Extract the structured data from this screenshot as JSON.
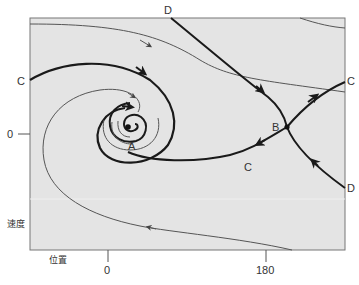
{
  "diagram": {
    "type": "phase-portrait",
    "axes": {
      "x_label": "位置",
      "y_label": "速度",
      "x_ticks": [
        "0",
        "180"
      ],
      "y_ticks": [
        "0"
      ]
    },
    "points": {
      "A": "A",
      "B": "B"
    },
    "curve_labels": {
      "c_left": "C",
      "c_right": "C",
      "c_bottom": "C",
      "d_top": "D",
      "d_right": "D"
    },
    "colors": {
      "plot_background": "#e4e4e4",
      "frame": "#777777",
      "thick_curve": "#1a1a1a",
      "thin_curve": "#555555"
    }
  }
}
